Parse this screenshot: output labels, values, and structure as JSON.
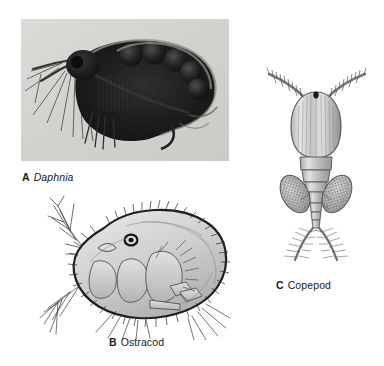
{
  "figure": {
    "background_color": "#ffffff",
    "panel_count": 3
  },
  "panels": [
    {
      "id": "a",
      "letter": "A",
      "name": "Daphnia",
      "name_style": "italic",
      "art_type": "photomicrograph",
      "subject": "water flea with eggs in brood chamber",
      "icon": "daphnia-photo",
      "tone": "grayscale"
    },
    {
      "id": "b",
      "letter": "B",
      "name": "Ostracod",
      "name_style": "normal",
      "art_type": "line-drawing",
      "subject": "bivalved carapace with marginal setae and branched antenna",
      "icon": "ostracod-drawing",
      "tone": "gray-shaded"
    },
    {
      "id": "c",
      "letter": "C",
      "name": "Copepod",
      "name_style": "normal",
      "art_type": "line-drawing",
      "subject": "dorsal view with paired antennae, egg sacs and caudal rami",
      "icon": "copepod-drawing",
      "tone": "gray-shaded"
    }
  ],
  "colors": {
    "ink": "#1a1a1a",
    "photo_light": "#d8d6d2",
    "photo_dark": "#121212",
    "drawing_fill": "#cfcfcf",
    "drawing_line": "#2b2b2b"
  }
}
